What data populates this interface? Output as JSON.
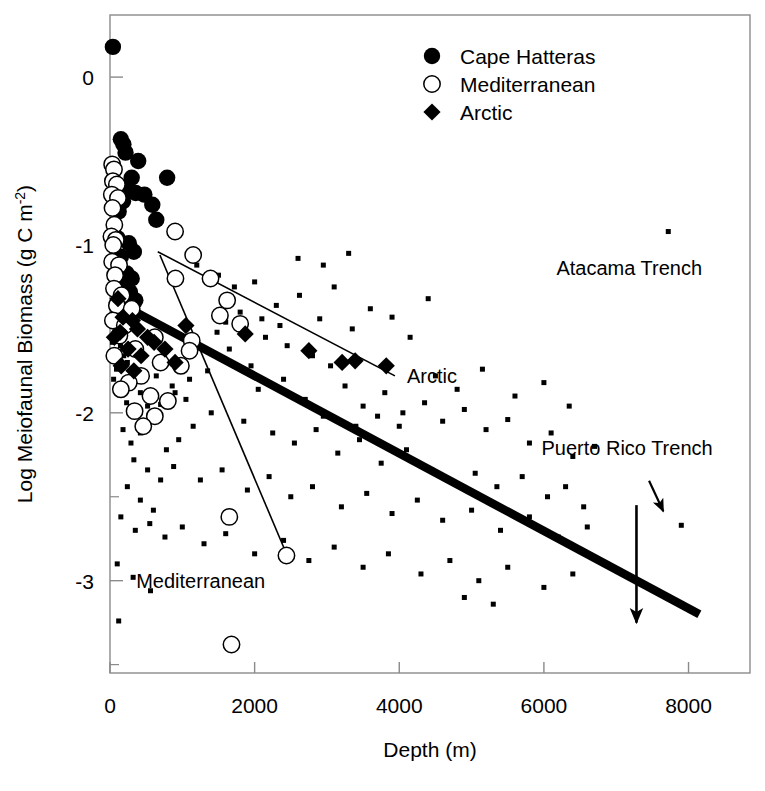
{
  "chart_data": {
    "type": "scatter",
    "title": "",
    "xlabel": "Depth (m)",
    "ylabel": "Log Meiofaunal Biomass (g C m-2)",
    "ylabel_main": "Log Meiofaunal Biomass (g C m",
    "ylabel_sup": "-2",
    "ylabel_tail": ")",
    "xlim": [
      0,
      8850
    ],
    "ylim": [
      -3.55,
      0.37
    ],
    "xticks": [
      0,
      2000,
      4000,
      6000,
      8000
    ],
    "xtick_labels": [
      "0",
      "2000",
      "4000",
      "6000",
      "8000"
    ],
    "yticks": [
      0,
      -1,
      -2,
      -3
    ],
    "ytick_labels": [
      "0",
      "-1",
      "-2",
      "-3"
    ],
    "yminor_ticks": [
      -0.5,
      -1.5,
      -2.5,
      -3.5
    ],
    "grid": false,
    "legend_position": "top-center",
    "series": [
      {
        "name": "Cape Hatteras",
        "marker": "filled-circle",
        "color": "#000000",
        "points": [
          [
            40,
            0.18
          ],
          [
            150,
            -0.37
          ],
          [
            185,
            -0.4
          ],
          [
            215,
            -0.45
          ],
          [
            390,
            -0.5
          ],
          [
            300,
            -0.6
          ],
          [
            790,
            -0.6
          ],
          [
            225,
            -0.66
          ],
          [
            355,
            -0.69
          ],
          [
            475,
            -0.7
          ],
          [
            180,
            -0.74
          ],
          [
            585,
            -0.76
          ],
          [
            120,
            -0.8
          ],
          [
            640,
            -0.85
          ],
          [
            105,
            -0.96
          ],
          [
            260,
            -0.99
          ],
          [
            330,
            -1.04
          ],
          [
            150,
            -1.07
          ],
          [
            230,
            -1.17
          ],
          [
            300,
            -1.2
          ],
          [
            205,
            -1.25
          ],
          [
            275,
            -1.28
          ],
          [
            160,
            -1.32
          ],
          [
            350,
            -1.33
          ],
          [
            120,
            -1.38
          ],
          [
            250,
            -1.42
          ],
          [
            185,
            -1.45
          ]
        ]
      },
      {
        "name": "Mediterranean",
        "marker": "open-circle",
        "color": "#000000",
        "points": [
          [
            30,
            -0.52
          ],
          [
            55,
            -0.55
          ],
          [
            40,
            -0.62
          ],
          [
            95,
            -0.64
          ],
          [
            25,
            -0.7
          ],
          [
            110,
            -0.72
          ],
          [
            35,
            -0.78
          ],
          [
            60,
            -0.88
          ],
          [
            20,
            -0.95
          ],
          [
            80,
            -0.97
          ],
          [
            45,
            -1.0
          ],
          [
            900,
            -0.92
          ],
          [
            1150,
            -1.06
          ],
          [
            30,
            -1.1
          ],
          [
            125,
            -1.12
          ],
          [
            70,
            -1.18
          ],
          [
            905,
            -1.2
          ],
          [
            1390,
            -1.2
          ],
          [
            55,
            -1.26
          ],
          [
            160,
            -1.3
          ],
          [
            1620,
            -1.33
          ],
          [
            95,
            -1.36
          ],
          [
            300,
            -1.38
          ],
          [
            1520,
            -1.42
          ],
          [
            40,
            -1.45
          ],
          [
            205,
            -1.48
          ],
          [
            1800,
            -1.47
          ],
          [
            130,
            -1.54
          ],
          [
            620,
            -1.55
          ],
          [
            1130,
            -1.57
          ],
          [
            350,
            -1.62
          ],
          [
            60,
            -1.66
          ],
          [
            700,
            -1.7
          ],
          [
            980,
            -1.72
          ],
          [
            430,
            -1.78
          ],
          [
            260,
            -1.82
          ],
          [
            150,
            -1.86
          ],
          [
            560,
            -1.9
          ],
          [
            800,
            -1.93
          ],
          [
            340,
            -1.99
          ],
          [
            620,
            -2.02
          ],
          [
            460,
            -2.08
          ],
          [
            1100,
            -1.63
          ],
          [
            1650,
            -2.62
          ],
          [
            2440,
            -2.85
          ],
          [
            1680,
            -3.38
          ]
        ]
      },
      {
        "name": "Arctic",
        "marker": "filled-diamond",
        "color": "#000000",
        "points": [
          [
            110,
            -1.32
          ],
          [
            180,
            -1.43
          ],
          [
            140,
            -1.52
          ],
          [
            60,
            -1.55
          ],
          [
            310,
            -1.45
          ],
          [
            380,
            -1.5
          ],
          [
            520,
            -1.55
          ],
          [
            610,
            -1.58
          ],
          [
            760,
            -1.62
          ],
          [
            250,
            -1.62
          ],
          [
            430,
            -1.66
          ],
          [
            1050,
            -1.48
          ],
          [
            1870,
            -1.53
          ],
          [
            2750,
            -1.63
          ],
          [
            3210,
            -1.7
          ],
          [
            3820,
            -1.72
          ],
          [
            3390,
            -1.69
          ],
          [
            900,
            -1.7
          ],
          [
            155,
            -1.72
          ],
          [
            330,
            -1.75
          ]
        ]
      },
      {
        "name": "Global (background)",
        "marker": "small-square",
        "color": "#000000",
        "points": [
          [
            60,
            -1.12
          ],
          [
            95,
            -1.2
          ],
          [
            130,
            -1.26
          ],
          [
            75,
            -1.33
          ],
          [
            45,
            -1.4
          ],
          [
            110,
            -1.44
          ],
          [
            165,
            -1.48
          ],
          [
            210,
            -1.35
          ],
          [
            260,
            -1.42
          ],
          [
            70,
            -1.52
          ],
          [
            35,
            -1.58
          ],
          [
            145,
            -1.6
          ],
          [
            190,
            -1.66
          ],
          [
            240,
            -1.7
          ],
          [
            90,
            -1.74
          ],
          [
            50,
            -1.8
          ],
          [
            300,
            -1.28
          ],
          [
            1200,
            -1.12
          ],
          [
            1500,
            -1.18
          ],
          [
            1720,
            -1.25
          ],
          [
            2000,
            -1.22
          ],
          [
            2300,
            -1.36
          ],
          [
            2620,
            -1.3
          ],
          [
            2900,
            -1.44
          ],
          [
            3100,
            -1.25
          ],
          [
            3350,
            -1.5
          ],
          [
            3600,
            -1.38
          ],
          [
            3900,
            -1.43
          ],
          [
            4150,
            -1.55
          ],
          [
            4400,
            -1.32
          ],
          [
            2150,
            -1.55
          ],
          [
            2450,
            -1.6
          ],
          [
            2800,
            -1.66
          ],
          [
            3050,
            -1.72
          ],
          [
            1950,
            -1.72
          ],
          [
            1650,
            -1.62
          ],
          [
            1350,
            -1.75
          ],
          [
            1100,
            -1.8
          ],
          [
            900,
            -1.88
          ],
          [
            700,
            -1.95
          ],
          [
            2050,
            -1.86
          ],
          [
            2400,
            -1.8
          ],
          [
            2700,
            -1.92
          ],
          [
            3250,
            -1.84
          ],
          [
            3500,
            -1.96
          ],
          [
            3800,
            -1.88
          ],
          [
            4050,
            -2.0
          ],
          [
            4350,
            -1.94
          ],
          [
            4600,
            -2.05
          ],
          [
            4900,
            -1.98
          ],
          [
            5200,
            -2.1
          ],
          [
            5500,
            -2.04
          ],
          [
            5800,
            -2.18
          ],
          [
            6100,
            -2.12
          ],
          [
            6400,
            -2.26
          ],
          [
            6700,
            -2.2
          ],
          [
            1850,
            -2.05
          ],
          [
            2250,
            -2.12
          ],
          [
            2550,
            -2.18
          ],
          [
            2850,
            -2.1
          ],
          [
            3150,
            -2.24
          ],
          [
            3450,
            -2.16
          ],
          [
            3750,
            -2.3
          ],
          [
            4100,
            -2.22
          ],
          [
            1400,
            -2.0
          ],
          [
            1150,
            -2.08
          ],
          [
            950,
            -2.16
          ],
          [
            780,
            -2.22
          ],
          [
            560,
            -2.05
          ],
          [
            420,
            -2.12
          ],
          [
            290,
            -2.18
          ],
          [
            180,
            -2.1
          ],
          [
            330,
            -2.28
          ],
          [
            520,
            -2.34
          ],
          [
            700,
            -2.4
          ],
          [
            880,
            -2.32
          ],
          [
            1250,
            -2.4
          ],
          [
            1550,
            -2.34
          ],
          [
            1900,
            -2.46
          ],
          [
            2200,
            -2.38
          ],
          [
            2500,
            -2.5
          ],
          [
            2800,
            -2.44
          ],
          [
            3200,
            -2.56
          ],
          [
            3550,
            -2.48
          ],
          [
            3900,
            -2.6
          ],
          [
            4250,
            -2.52
          ],
          [
            4600,
            -2.64
          ],
          [
            5000,
            -2.58
          ],
          [
            5400,
            -2.7
          ],
          [
            5800,
            -2.62
          ],
          [
            6200,
            -2.74
          ],
          [
            6600,
            -2.68
          ],
          [
            240,
            -2.44
          ],
          [
            420,
            -2.52
          ],
          [
            600,
            -2.58
          ],
          [
            150,
            -2.62
          ],
          [
            350,
            -2.7
          ],
          [
            550,
            -2.66
          ],
          [
            760,
            -2.74
          ],
          [
            1000,
            -2.68
          ],
          [
            1300,
            -2.78
          ],
          [
            1600,
            -2.72
          ],
          [
            2000,
            -2.84
          ],
          [
            2400,
            -2.76
          ],
          [
            2750,
            -2.88
          ],
          [
            3100,
            -2.8
          ],
          [
            3500,
            -2.92
          ],
          [
            3850,
            -2.84
          ],
          [
            4300,
            -2.96
          ],
          [
            4700,
            -2.88
          ],
          [
            5100,
            -3.0
          ],
          [
            5500,
            -2.92
          ],
          [
            6000,
            -3.04
          ],
          [
            6400,
            -2.96
          ],
          [
            4900,
            -3.1
          ],
          [
            5300,
            -3.14
          ],
          [
            100,
            -2.9
          ],
          [
            320,
            -2.98
          ],
          [
            560,
            -3.06
          ],
          [
            120,
            -3.24
          ],
          [
            7720,
            -0.92
          ],
          [
            7900,
            -2.67
          ],
          [
            2950,
            -1.12
          ],
          [
            3300,
            -1.05
          ],
          [
            2600,
            -1.08
          ],
          [
            1480,
            -1.52
          ],
          [
            4500,
            -1.78
          ],
          [
            4800,
            -1.86
          ],
          [
            5150,
            -1.74
          ],
          [
            5600,
            -1.9
          ],
          [
            6000,
            -1.82
          ],
          [
            6350,
            -1.96
          ],
          [
            2100,
            -1.44
          ],
          [
            2350,
            -1.48
          ],
          [
            1800,
            -1.4
          ],
          [
            1600,
            -1.46
          ],
          [
            3700,
            -2.02
          ],
          [
            4000,
            -2.08
          ],
          [
            2950,
            -2.02
          ],
          [
            3400,
            -2.08
          ],
          [
            4450,
            -2.34
          ],
          [
            4750,
            -2.42
          ],
          [
            5050,
            -2.36
          ],
          [
            5350,
            -2.44
          ],
          [
            5700,
            -2.38
          ],
          [
            6050,
            -2.5
          ],
          [
            6300,
            -2.44
          ],
          [
            6550,
            -2.56
          ],
          [
            420,
            -1.88
          ],
          [
            640,
            -1.78
          ],
          [
            860,
            -1.84
          ],
          [
            1050,
            -1.92
          ],
          [
            230,
            -1.94
          ],
          [
            380,
            -2.0
          ],
          [
            520,
            -1.96
          ]
        ]
      }
    ],
    "trend_lines": [
      {
        "name": "global-regression",
        "label": "",
        "style": "thick",
        "x0": 10,
        "y0": -1.32,
        "x1": 8150,
        "y1": -3.2
      },
      {
        "name": "arctic-regression",
        "label": "Arctic",
        "style": "thin",
        "x0": 660,
        "y0": -1.04,
        "x1": 3940,
        "y1": -1.78
      },
      {
        "name": "mediterranean-regression",
        "label": "Mediterranean",
        "style": "thin",
        "x0": 690,
        "y0": -1.06,
        "x1": 2450,
        "y1": -2.85
      }
    ],
    "annotations": [
      {
        "name": "atacama-trench",
        "label": "Atacama Trench",
        "point_x": 7720,
        "point_y": -0.92,
        "text_x": 7180,
        "text_y": -1.18,
        "arrow": "none"
      },
      {
        "name": "puerto-rico-trench",
        "label": "Puerto Rico Trench",
        "point_x": 7900,
        "point_y": -2.67,
        "text_x": 7150,
        "text_y": -2.25,
        "arrow": "diagonal"
      },
      {
        "name": "depth-arrow",
        "label": "",
        "point_x": 7280,
        "point_y": -3.25,
        "text_x": 7280,
        "text_y": -2.55,
        "arrow": "vertical"
      }
    ],
    "legend": [
      {
        "label": "Cape Hatteras",
        "marker": "filled-circle"
      },
      {
        "label": "Mediterranean",
        "marker": "open-circle"
      },
      {
        "label": "Arctic",
        "marker": "filled-diamond"
      }
    ]
  }
}
